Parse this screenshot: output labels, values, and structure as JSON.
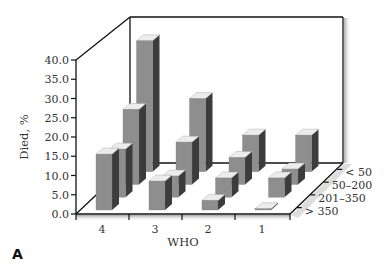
{
  "panel_label": "A",
  "chart_data": {
    "type": "bar",
    "subtype": "3d-grouped-bar",
    "title": "",
    "xlabel": "WHO",
    "ylabel": "Died, %",
    "zlabel": "",
    "categories": [
      "4",
      "3",
      "2",
      "1"
    ],
    "y_ticks": [
      "0.0",
      "5.0",
      "10.0",
      "15.0",
      "20.0",
      "25.0",
      "30.0",
      "35.0",
      "40.0"
    ],
    "ylim": [
      0,
      40
    ],
    "grid": false,
    "legend_position": "none",
    "depth_categories": [
      "> 350",
      "201–350",
      "50–200",
      "< 50"
    ],
    "series": [
      {
        "name": "> 350",
        "values": [
          14.5,
          7.5,
          2.5,
          0.3
        ]
      },
      {
        "name": "201–350",
        "values": [
          12.5,
          5.5,
          5.0,
          5.0
        ]
      },
      {
        "name": "50–200",
        "values": [
          19.5,
          11.0,
          7.0,
          4.0
        ]
      },
      {
        "name": "< 50",
        "values": [
          34.0,
          19.0,
          9.5,
          9.5
        ]
      }
    ],
    "colors": {
      "front": "#8e8e8e",
      "side": "#3c3c3c",
      "top": "#ececec"
    }
  }
}
